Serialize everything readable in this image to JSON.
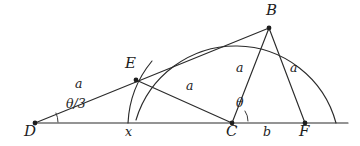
{
  "figure": {
    "background_color": "#ffffff",
    "ink_color": "#2b2b2b"
  },
  "points": [
    {
      "id": "D",
      "label": "D",
      "x": 35,
      "y": 123,
      "label_x": 24,
      "label_y": 126
    },
    {
      "id": "E",
      "label": "E",
      "x": 136,
      "y": 80,
      "label_x": 126,
      "label_y": 60
    },
    {
      "id": "B",
      "label": "B",
      "x": 269,
      "y": 28,
      "label_x": 269,
      "label_y": 6
    },
    {
      "id": "C",
      "label": "C",
      "x": 232,
      "y": 123,
      "label_x": 226,
      "label_y": 126
    },
    {
      "id": "F",
      "label": "F",
      "x": 305,
      "y": 123,
      "label_x": 300,
      "label_y": 126
    }
  ],
  "segment_labels": [
    {
      "id": "a-DE",
      "text": "a",
      "x": 78,
      "y": 84,
      "of": "DE"
    },
    {
      "id": "a-EC",
      "text": "a",
      "x": 188,
      "y": 86,
      "of": "EC"
    },
    {
      "id": "a-CB",
      "text": "a",
      "x": 238,
      "y": 68,
      "of": "CB"
    },
    {
      "id": "a-BF",
      "text": "a",
      "x": 292,
      "y": 68,
      "of": "BF"
    },
    {
      "id": "x-base",
      "text": "x",
      "x": 128,
      "y": 128,
      "of": "baseline-left"
    },
    {
      "id": "b-base",
      "text": "b",
      "x": 265,
      "y": 128,
      "of": "baseline-right"
    }
  ],
  "angle_labels": [
    {
      "id": "theta-over-3",
      "text": "θ/3",
      "x": 72,
      "y": 103,
      "at_point": "D"
    },
    {
      "id": "theta",
      "text": "θ",
      "x": 238,
      "y": 101,
      "at_point": "C"
    }
  ],
  "geometry": {
    "baseline": {
      "x1": 35,
      "y1": 123,
      "x2": 348,
      "y2": 123
    },
    "arcs": [
      {
        "id": "major-semicircle",
        "center_x": 232,
        "center_y": 123,
        "radius": 104,
        "path": "M 136 120 A 104 104 0 0 1 336 123",
        "note": "large arc through B ending on the base line right of F"
      },
      {
        "id": "minor-arc-through-E",
        "center_x": 232,
        "center_y": 123,
        "radius": 105,
        "path": "M 128 123 A 105 105 0 0 1 152 61",
        "note": "short arc centered at C passing through E, meeting base line at x"
      }
    ],
    "segments": [
      {
        "id": "seg-DB",
        "x1": 35,
        "y1": 123,
        "x2": 269,
        "y2": 28
      },
      {
        "id": "seg-EC",
        "x1": 136,
        "y1": 80,
        "x2": 232,
        "y2": 123
      },
      {
        "id": "seg-CB",
        "x1": 232,
        "y1": 123,
        "x2": 269,
        "y2": 28
      },
      {
        "id": "seg-BF",
        "x1": 269,
        "y1": 28,
        "x2": 305,
        "y2": 123
      }
    ],
    "angle_arcs": [
      {
        "id": "angle-arc-D",
        "path": "M 58 122 A 23 23 0 0 0 56 113"
      },
      {
        "id": "angle-arc-C",
        "path": "M 248 121 A 17 17 0 0 0 245 111"
      }
    ]
  }
}
